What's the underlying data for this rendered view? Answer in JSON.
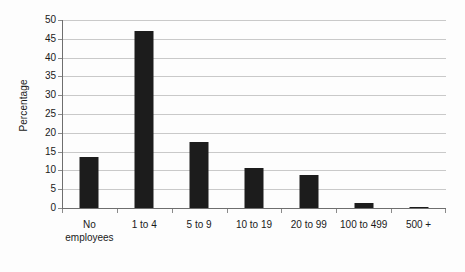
{
  "chart_data": {
    "type": "bar",
    "title": "",
    "subtitle": "",
    "xlabel": "",
    "ylabel": "Percentage",
    "ylim": [
      0,
      50
    ],
    "ytick_step": 5,
    "yticks": [
      0,
      5,
      10,
      15,
      20,
      25,
      30,
      35,
      40,
      45,
      50
    ],
    "ytick_labels": [
      "0",
      "5",
      "10",
      "15",
      "20",
      "25",
      "30",
      "35",
      "40",
      "45",
      "50"
    ],
    "grid": "horizontal",
    "legend": "none",
    "bar_color": "#1c1c1c",
    "gridline_color": "#c9c9c9",
    "axis_color": "#6e6e6e",
    "background_color": "#fdfdfd",
    "categories": [
      "No employees",
      "1 to 4",
      "5 to 9",
      "10 to 19",
      "20 to 99",
      "100 to 499",
      "500 +"
    ],
    "category_label_lines": [
      [
        "No",
        "employees"
      ],
      [
        "1 to 4"
      ],
      [
        "5 to 9"
      ],
      [
        "10 to 19"
      ],
      [
        "20 to 99"
      ],
      [
        "100 to 499"
      ],
      [
        "500 +"
      ]
    ],
    "values": [
      13.5,
      47.2,
      17.6,
      10.7,
      8.8,
      1.4,
      0.2
    ],
    "series": [
      {
        "name": "Percentage",
        "values": [
          13.5,
          47.2,
          17.6,
          10.7,
          8.8,
          1.4,
          0.2
        ]
      }
    ]
  }
}
